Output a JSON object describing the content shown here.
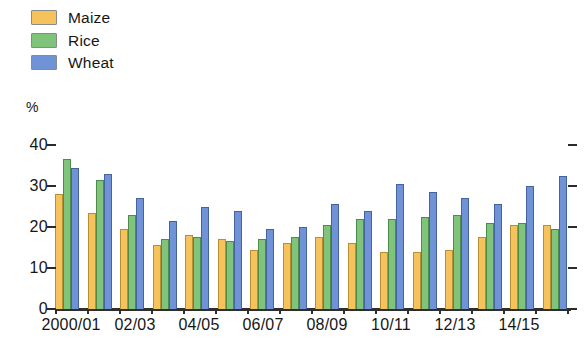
{
  "legend": {
    "items": [
      {
        "label": "Maize",
        "color": "#f6c25b",
        "icon": "color-swatch-icon"
      },
      {
        "label": "Rice",
        "color": "#7fc47a",
        "icon": "color-swatch-icon"
      },
      {
        "label": "Wheat",
        "color": "#6f93d6",
        "icon": "color-swatch-icon"
      }
    ]
  },
  "axis": {
    "unit_label": "%",
    "y_ticks": [
      "40",
      "30",
      "20",
      "10",
      "0"
    ],
    "x_tick_labels": [
      "2000/01",
      "02/03",
      "04/05",
      "06/07",
      "08/09",
      "10/11",
      "12/13",
      "14/15"
    ]
  },
  "chart_data": {
    "type": "bar",
    "title": "",
    "xlabel": "",
    "ylabel": "%",
    "ylim": [
      0,
      40
    ],
    "ytick_values": [
      0,
      10,
      20,
      30,
      40
    ],
    "grid": false,
    "legend_position": "top-left",
    "categories": [
      "2000/01",
      "01/02",
      "02/03",
      "03/04",
      "04/05",
      "05/06",
      "06/07",
      "07/08",
      "08/09",
      "09/10",
      "10/11",
      "11/12",
      "12/13",
      "13/14",
      "14/15",
      "15/16"
    ],
    "labeled_categories": [
      "2000/01",
      "02/03",
      "04/05",
      "06/07",
      "08/09",
      "10/11",
      "12/13",
      "14/15"
    ],
    "series": [
      {
        "name": "Maize",
        "color": "#f6c25b",
        "values": [
          28,
          23.5,
          19.5,
          15.5,
          18,
          17,
          14.5,
          16,
          17.5,
          16,
          14,
          14,
          14.5,
          17.5,
          20.5,
          20.5
        ]
      },
      {
        "name": "Rice",
        "color": "#7fc47a",
        "values": [
          36.5,
          31.5,
          23,
          17,
          17.5,
          16.5,
          17,
          17.5,
          20.5,
          22,
          22,
          22.5,
          23,
          21,
          21,
          19.5
        ]
      },
      {
        "name": "Wheat",
        "color": "#6f93d6",
        "values": [
          34.5,
          33,
          27,
          21.5,
          25,
          24,
          19.5,
          20,
          25.5,
          24,
          30.5,
          28.5,
          27,
          25.5,
          30,
          32.5
        ]
      }
    ]
  }
}
